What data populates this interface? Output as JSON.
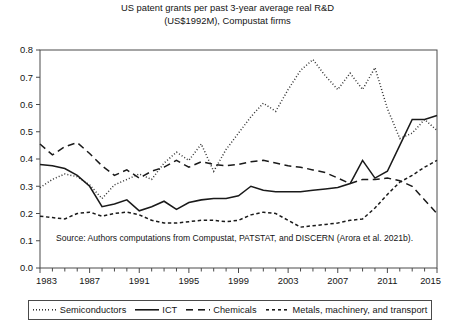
{
  "title": {
    "line1": "US patent grants per past 3-year average real R&D",
    "line2": "(US$1992M), Compustat firms"
  },
  "source_note": "Source: Authors computations from Compustat, PATSTAT, and DISCERN (Arora et al. 2021b).",
  "legend": {
    "items": [
      {
        "label": "Semiconductors",
        "style": "dotted",
        "color": "#333333"
      },
      {
        "label": "ICT",
        "style": "solid",
        "color": "#1a1a1a"
      },
      {
        "label": "Chemicals",
        "style": "dashed-long",
        "color": "#1a1a1a"
      },
      {
        "label": "Metals, machinery, and transport",
        "style": "dashed-short",
        "color": "#1a1a1a"
      }
    ]
  },
  "chart_data": {
    "type": "line",
    "title": "US patent grants per past 3-year average real R&D (US$1992M), Compustat firms",
    "xlabel": "",
    "ylabel": "",
    "xlim": [
      1983,
      2015
    ],
    "ylim": [
      0.0,
      0.8
    ],
    "grid": false,
    "legend_position": "bottom",
    "x_tick_labels": [
      "1983",
      "1987",
      "1991",
      "1995",
      "1999",
      "2003",
      "2007",
      "2011",
      "2015"
    ],
    "x_tick_values": [
      1983,
      1987,
      1991,
      1995,
      1999,
      2003,
      2007,
      2011,
      2015
    ],
    "x_minor_tick_step": 1,
    "y_tick_labels": [
      "0.0",
      "0.1",
      "0.2",
      "0.3",
      "0.4",
      "0.5",
      "0.6",
      "0.7",
      "0.8"
    ],
    "y_tick_values": [
      0.0,
      0.1,
      0.2,
      0.3,
      0.4,
      0.5,
      0.6,
      0.7,
      0.8
    ],
    "x": [
      1983,
      1984,
      1985,
      1986,
      1987,
      1988,
      1989,
      1990,
      1991,
      1992,
      1993,
      1994,
      1995,
      1996,
      1997,
      1998,
      1999,
      2000,
      2001,
      2002,
      2003,
      2004,
      2005,
      2006,
      2007,
      2008,
      2009,
      2010,
      2011,
      2012,
      2013,
      2014,
      2015
    ],
    "series": [
      {
        "name": "Semiconductors",
        "style": "dotted",
        "values": [
          0.295,
          0.325,
          0.345,
          0.335,
          0.305,
          0.255,
          0.305,
          0.325,
          0.345,
          0.325,
          0.385,
          0.425,
          0.395,
          0.455,
          0.355,
          0.435,
          0.495,
          0.555,
          0.605,
          0.575,
          0.655,
          0.725,
          0.765,
          0.705,
          0.655,
          0.715,
          0.655,
          0.735,
          0.585,
          0.475,
          0.495,
          0.545,
          0.505
        ]
      },
      {
        "name": "ICT",
        "style": "solid",
        "values": [
          0.38,
          0.375,
          0.365,
          0.34,
          0.3,
          0.225,
          0.235,
          0.25,
          0.21,
          0.225,
          0.245,
          0.215,
          0.24,
          0.25,
          0.255,
          0.255,
          0.265,
          0.3,
          0.285,
          0.28,
          0.28,
          0.28,
          0.285,
          0.29,
          0.295,
          0.31,
          0.395,
          0.33,
          0.355,
          0.45,
          0.545,
          0.545,
          0.56
        ]
      },
      {
        "name": "Chemicals",
        "style": "dashed-long",
        "values": [
          0.455,
          0.415,
          0.445,
          0.46,
          0.42,
          0.375,
          0.34,
          0.36,
          0.33,
          0.355,
          0.37,
          0.395,
          0.37,
          0.39,
          0.38,
          0.375,
          0.38,
          0.39,
          0.395,
          0.385,
          0.375,
          0.37,
          0.36,
          0.35,
          0.33,
          0.31,
          0.325,
          0.325,
          0.33,
          0.32,
          0.3,
          0.25,
          0.2
        ]
      },
      {
        "name": "Metals, machinery, and transport",
        "style": "dashed-short",
        "values": [
          0.19,
          0.185,
          0.18,
          0.2,
          0.205,
          0.19,
          0.2,
          0.205,
          0.195,
          0.175,
          0.165,
          0.165,
          0.17,
          0.175,
          0.175,
          0.17,
          0.175,
          0.195,
          0.205,
          0.2,
          0.175,
          0.15,
          0.155,
          0.16,
          0.165,
          0.175,
          0.18,
          0.22,
          0.27,
          0.315,
          0.34,
          0.37,
          0.395
        ]
      }
    ]
  },
  "plot_geometry": {
    "left": 40,
    "right": 437,
    "top": 50,
    "bottom": 268
  }
}
